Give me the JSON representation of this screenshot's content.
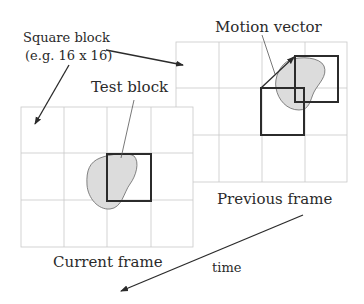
{
  "diagram": {
    "labels": {
      "square_block_line1": "Square block",
      "square_block_line2": "(e.g. 16 x 16)",
      "test_block": "Test block",
      "motion_vector": "Motion vector",
      "previous_frame": "Previous frame",
      "current_frame": "Current frame",
      "time": "time"
    },
    "frames": [
      {
        "name": "Current frame",
        "grid": "4 x 3 blocks",
        "contains": [
          "Test block",
          "object"
        ]
      },
      {
        "name": "Previous frame",
        "grid": "4 x 3 blocks",
        "contains": [
          "Co-located block",
          "Best-match block",
          "object",
          "Motion vector"
        ]
      }
    ],
    "edges": [
      {
        "from": "Square block label",
        "to": "Current frame grid cell",
        "type": "arrow"
      },
      {
        "from": "Square block label",
        "to": "Previous frame grid cell",
        "type": "arrow"
      },
      {
        "from": "Test block label",
        "to": "Test block",
        "type": "leader"
      },
      {
        "from": "Motion vector label",
        "to": "Motion vector arrow",
        "type": "leader"
      },
      {
        "from": "Co-located block corner",
        "to": "Best-match block corner",
        "type": "arrow",
        "label": "Motion vector"
      },
      {
        "from": "Previous frame",
        "to": "Current frame",
        "type": "arrow",
        "label": "time"
      }
    ],
    "colors": {
      "grid": "#c8c8c8",
      "block_outline": "#2b2b2b",
      "object_fill": "#dcdcdc",
      "text": "#2a2a2a"
    }
  }
}
